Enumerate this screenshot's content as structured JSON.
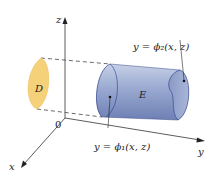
{
  "axes": {
    "z_label": "z",
    "y_label": "y",
    "x_label": "x",
    "origin_label": "0"
  },
  "regions": {
    "projection_label": "D",
    "solid_label": "E"
  },
  "surfaces": {
    "right_label": "y = ϕ₂(x, z)",
    "left_label": "y = ϕ₁(x, z)"
  },
  "colors": {
    "projection_fill": "#f5d27a",
    "solid_fill": "#8da0cc",
    "solid_edge": "#2a3c8a",
    "axis": "#333333"
  }
}
